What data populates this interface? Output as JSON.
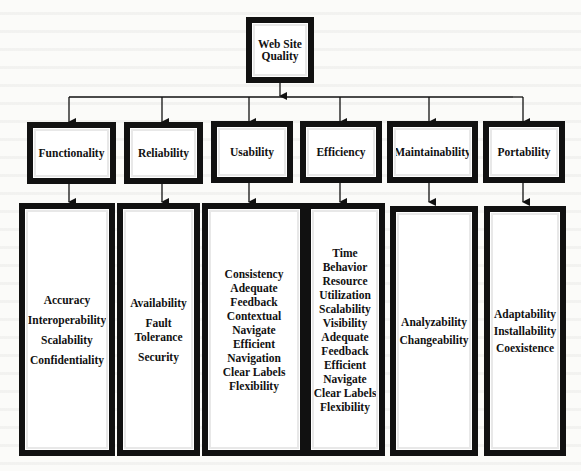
{
  "root": {
    "label": "Web Site Quality"
  },
  "categories": [
    {
      "label": "Functionality",
      "items": [
        "Accuracy",
        "Interoperability",
        "Scalability",
        "Confidentiality"
      ]
    },
    {
      "label": "Reliability",
      "items": [
        "Availability",
        "Fault Tolerance",
        "Security"
      ]
    },
    {
      "label": "Usability",
      "items": [
        "Consistency",
        "Adequate",
        "Feedback",
        "Contextual",
        "Navigate",
        "Efficient",
        "Navigation",
        "Clear Labels",
        "Flexibility"
      ]
    },
    {
      "label": "Efficiency",
      "items": [
        "Time",
        "Behavior",
        "Resource",
        "Utilization",
        "Scalability",
        "Visibility",
        "Adequate",
        "Feedback",
        "Efficient",
        "Navigate",
        "Clear Labels",
        "Flexibility"
      ]
    },
    {
      "label": "Maintainability",
      "items": [
        "Analyzability",
        "Changeability"
      ]
    },
    {
      "label": "Portability",
      "items": [
        "Adaptability",
        "Installability",
        "Coexistence"
      ]
    }
  ],
  "colors": {
    "border": "#111111",
    "background": "#fbfbf9",
    "box_fill": "#ffffff"
  }
}
